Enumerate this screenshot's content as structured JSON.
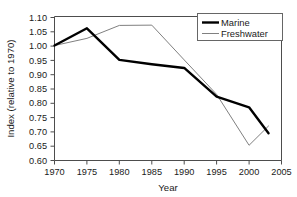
{
  "chart_data": {
    "type": "line",
    "title": "",
    "xlabel": "Year",
    "ylabel": "Index (relative to 1970)",
    "xlim": [
      1970,
      2005
    ],
    "ylim": [
      0.6,
      1.1
    ],
    "grid": false,
    "legend_position": "top-right",
    "xticks": [
      1970,
      1975,
      1980,
      1985,
      1990,
      1995,
      2000,
      2005
    ],
    "xtick_labels": [
      "1970",
      "1975",
      "1980",
      "1985",
      "1990",
      "1995",
      "2000",
      "2005"
    ],
    "yticks": [
      0.6,
      0.65,
      0.7,
      0.75,
      0.8,
      0.85,
      0.9,
      0.95,
      1.0,
      1.05,
      1.1
    ],
    "ytick_labels": [
      "0.60",
      "0.65",
      "0.70",
      "0.75",
      "0.80",
      "0.85",
      "0.90",
      "0.95",
      "1.00",
      "1.05",
      "1.10"
    ],
    "series": [
      {
        "name": "Marine",
        "color": "#000000",
        "line_width": 2.4,
        "x": [
          1970,
          1975,
          1980,
          1985,
          1990,
          1995,
          2000,
          2003
        ],
        "values": [
          1.0,
          1.06,
          0.95,
          0.935,
          0.922,
          0.822,
          0.785,
          0.695
        ]
      },
      {
        "name": "Freshwater",
        "color": "#808080",
        "line_width": 1.0,
        "x": [
          1970,
          1975,
          1980,
          1985,
          1990,
          1995,
          2000,
          2003
        ],
        "values": [
          1.0,
          1.025,
          1.07,
          1.071,
          0.95,
          0.83,
          0.653,
          0.72
        ]
      }
    ]
  },
  "legend": {
    "items": [
      {
        "label": "Marine"
      },
      {
        "label": "Freshwater"
      }
    ]
  },
  "axes": {
    "x_title": "Year",
    "y_title": "Index (relative to 1970)"
  }
}
